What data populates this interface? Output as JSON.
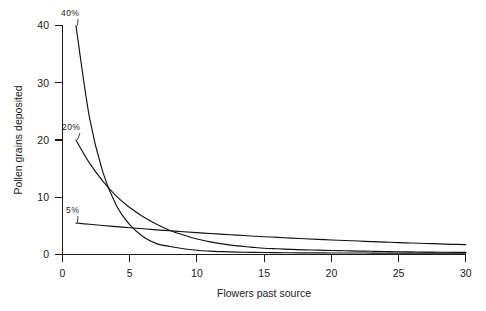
{
  "chart_data": {
    "type": "line",
    "title": "",
    "xlabel": "Flowers past source",
    "ylabel": "Pollen grains deposited",
    "xlim": [
      0,
      30
    ],
    "ylim": [
      0,
      40
    ],
    "xticks": [
      0,
      5,
      10,
      15,
      20,
      25,
      30
    ],
    "yticks": [
      0,
      10,
      20,
      30,
      40
    ],
    "grid": false,
    "legend_position": "inline-curve-labels",
    "x": [
      1,
      2,
      3,
      4,
      5,
      6,
      7,
      8,
      9,
      10,
      11,
      12,
      13,
      14,
      15,
      16,
      17,
      18,
      19,
      20,
      21,
      22,
      23,
      24,
      25,
      26,
      27,
      28,
      29,
      30
    ],
    "series": [
      {
        "name": "40%",
        "label": "40%",
        "values": [
          40.0,
          24.0,
          14.4,
          8.6,
          5.2,
          3.1,
          1.9,
          1.4,
          1.0,
          0.75,
          0.6,
          0.5,
          0.42,
          0.38,
          0.34,
          0.32,
          0.3,
          0.29,
          0.28,
          0.27,
          0.26,
          0.26,
          0.25,
          0.25,
          0.25,
          0.25,
          0.24,
          0.24,
          0.24,
          0.24
        ]
      },
      {
        "name": "20%",
        "label": "20%",
        "values": [
          20.0,
          16.0,
          12.8,
          10.2,
          8.2,
          6.6,
          5.3,
          4.2,
          3.4,
          2.7,
          2.2,
          1.8,
          1.5,
          1.3,
          1.1,
          1.0,
          0.9,
          0.82,
          0.76,
          0.7,
          0.65,
          0.6,
          0.56,
          0.52,
          0.48,
          0.45,
          0.42,
          0.4,
          0.38,
          0.36
        ]
      },
      {
        "name": "5%",
        "label": "5%",
        "values": [
          5.5,
          5.28,
          5.07,
          4.87,
          4.67,
          4.49,
          4.31,
          4.14,
          3.97,
          3.81,
          3.66,
          3.52,
          3.38,
          3.24,
          3.11,
          2.99,
          2.87,
          2.76,
          2.65,
          2.54,
          2.44,
          2.35,
          2.26,
          2.17,
          2.08,
          2.0,
          1.93,
          1.85,
          1.78,
          1.72
        ]
      }
    ],
    "series_label_positions": [
      {
        "name": "40%",
        "x_px": 61,
        "y_px": 16
      },
      {
        "name": "20%",
        "x_px": 62,
        "y_px": 130
      },
      {
        "name": "5%",
        "x_px": 66,
        "y_px": 213
      }
    ],
    "colors": {
      "curve": "#111111",
      "axis": "#1a1a1a",
      "background": "#ffffff",
      "text": "#1a1a1a"
    }
  },
  "figure": {
    "background_color": "#ffffff"
  }
}
